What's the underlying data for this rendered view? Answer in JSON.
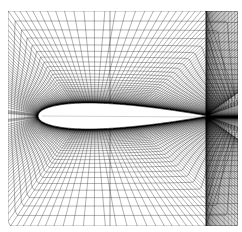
{
  "figure": {
    "kind": "cfd-structured-mesh",
    "title": "Structured C-grid mesh around a symmetric airfoil",
    "background_color": "#ffffff",
    "line_color": "#000000",
    "width_px": 242,
    "height_px": 232,
    "caption": ""
  },
  "chart_data": {
    "type": "mesh",
    "title": "Structured C-grid mesh around a symmetric airfoil",
    "subtitle": "",
    "xlabel": "",
    "ylabel": "",
    "grid": true,
    "legend_position": "none",
    "annotations": [],
    "domain": {
      "x_min_px": 8,
      "x_max_px": 238,
      "y_min_px": 11,
      "y_max_px": 226
    },
    "airfoil": {
      "name": "symmetric airfoil",
      "thickness_ratio": 0.12,
      "chord_px": 168,
      "leading_edge_px": [
        38,
        116
      ],
      "trailing_edge_px": [
        206,
        117
      ],
      "max_thickness_x_frac": 0.33,
      "max_half_thickness_px": 13,
      "angle_of_attack_deg": 0,
      "fill_color": "#ffffff",
      "outline_color": "#000000"
    },
    "mesh_topology": {
      "topology": "C-grid",
      "radial_lines": 196,
      "circumferential_lines": 132,
      "wall_normal_first_spacing_px": 0.05,
      "growth_ratio": 1.14,
      "wake_lines": 44,
      "clustering": "geometric stretching normal to wall; leading and trailing edge refinement",
      "boundary_layer_darkness": "saturated black near surface",
      "far_field_shape": "rectangular outer boundary"
    },
    "series": [
      {
        "name": "wall-normal grid lines",
        "count": 196,
        "description": "lines emanating outward from airfoil surface to outer boundary"
      },
      {
        "name": "wall-parallel grid lines",
        "count": 132,
        "description": "lines wrapping around airfoil, spacing grows geometrically away from wall"
      },
      {
        "name": "wake cut line",
        "count": 1,
        "description": "vertical branch cut above and below the airfoil at x=110 px"
      }
    ],
    "branch_cut": {
      "x_px": 110,
      "visible_top": true,
      "visible_bottom": true,
      "description": "darker vertical seam line through mid-chord"
    }
  }
}
